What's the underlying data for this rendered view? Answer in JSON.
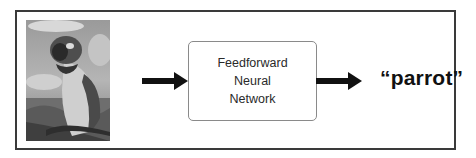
{
  "diagram": {
    "input": {
      "type": "image",
      "subject": "parrot photo (grayscale macaw)"
    },
    "model": {
      "lines": [
        "Feedforward",
        "Neural",
        "Network"
      ]
    },
    "output": {
      "label": "“parrot”"
    },
    "connectors": [
      {
        "from": "input",
        "to": "model",
        "style": "thick-arrow"
      },
      {
        "from": "model",
        "to": "output",
        "style": "thick-arrow"
      }
    ],
    "colors": {
      "frame": "#3a3a3a",
      "box_border": "#8a8a8a",
      "arrow": "#111111",
      "text": "#2a2a2a"
    }
  }
}
